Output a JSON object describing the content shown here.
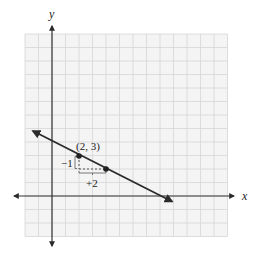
{
  "figure": {
    "type": "coordinate-plane-line-graph",
    "axes": {
      "x_label": "x",
      "y_label": "y",
      "grid_x_range": [
        -2,
        13
      ],
      "grid_y_range": [
        -3,
        12
      ],
      "grid_step": 1
    },
    "line": {
      "equation": "y = -1/2 x + 4",
      "slope": -0.5,
      "y_intercept": 4,
      "arrow_both_ends": true,
      "color": "#2b2b2b"
    },
    "points": [
      {
        "x": 2,
        "y": 3,
        "label": "(2, 3)"
      },
      {
        "x": 4,
        "y": 2,
        "label": ""
      }
    ],
    "slope_triangle": {
      "rise_label": "−1",
      "run_label": "+2"
    },
    "colors": {
      "grid": "#d6d6d6",
      "grid_bg": "#f4f4f4",
      "axis": "#333333",
      "line": "#2b2b2b"
    }
  }
}
